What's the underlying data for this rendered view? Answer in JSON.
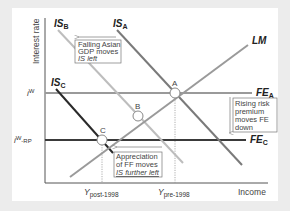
{
  "diagram": {
    "type": "IS-LM-FE",
    "axes": {
      "y_label": "Interest rate",
      "x_label": "Income",
      "y_ticks": [
        {
          "label": "i",
          "sup": "W",
          "level": "FE_A"
        },
        {
          "label": "i",
          "sup": "W",
          "tail": "-RP",
          "level": "FE_C"
        }
      ],
      "x_ticks": [
        {
          "label": "Y",
          "sub": "post-1998",
          "point": "C"
        },
        {
          "label": "Y",
          "sub": "pre-1998",
          "point": "A"
        }
      ]
    },
    "curves": {
      "IS_B": {
        "main": "IS",
        "sub": "B",
        "color": "#b8b8b8"
      },
      "IS_A": {
        "main": "IS",
        "sub": "A",
        "color": "#777777"
      },
      "IS_C": {
        "main": "IS",
        "sub": "C",
        "color": "#2a2a2a"
      },
      "LM": {
        "main": "LM",
        "color": "#9a9a9a"
      },
      "FE_A": {
        "main": "FE",
        "sub": "A",
        "color": "#9a9a9a"
      },
      "FE_C": {
        "main": "FE",
        "sub": "C",
        "color": "#3a3a3a"
      }
    },
    "points": [
      {
        "label": "A"
      },
      {
        "label": "B"
      },
      {
        "label": "C"
      }
    ],
    "annotations": {
      "falling_asian": [
        "Falling Asian",
        "GDP moves",
        "IS left"
      ],
      "rising_risk": [
        "Rising risk",
        "premium",
        "moves FE",
        "down"
      ],
      "appreciation": [
        "Appreciation",
        "of FF moves",
        "IS further left"
      ]
    }
  }
}
